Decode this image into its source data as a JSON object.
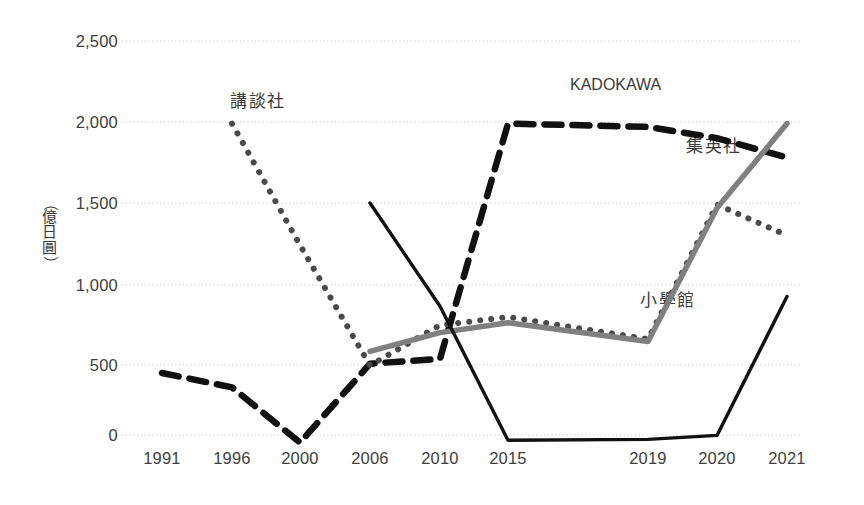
{
  "chart_data": {
    "type": "line",
    "title": "",
    "subtitle": "",
    "xlabel": "",
    "ylabel": "（億日圓）",
    "categories": [
      "1991",
      "1996",
      "2000",
      "2006",
      "2010",
      "2015",
      "2019",
      "2020",
      "2021"
    ],
    "ylim": [
      0,
      2500
    ],
    "yticks": [
      0,
      500,
      1000,
      1500,
      2000,
      2500
    ],
    "ytick_labels": [
      "0",
      "500",
      "1,000",
      "1,500",
      "2,000",
      "2,500"
    ],
    "grid": true,
    "legend_position": "inline-annotations",
    "series": [
      {
        "name": "KADOKAWA",
        "style": "dashed",
        "color": "#111111",
        "values": [
          550,
          640,
          985,
          1480,
          1450,
          2010,
          2030,
          2100,
          2220
        ]
      },
      {
        "name": "講談社",
        "style": "dotted",
        "color": "#4a4a4a",
        "values": [
          null,
          2010,
          1760,
          1490,
          1245,
          1195,
          1330,
          1510,
          1700
        ]
      },
      {
        "name": "集英社",
        "style": "solid-gray",
        "color": "#808080",
        "values": [
          null,
          null,
          null,
          1405,
          1290,
          1230,
          1345,
          1530,
          2010
        ]
      },
      {
        "name": "小學館",
        "style": "solid-black",
        "color": "#111111",
        "values": [
          null,
          null,
          null,
          1500,
          1130,
          970,
          965,
          940,
          1070
        ]
      }
    ]
  },
  "annotations": [
    {
      "text": "KADOKAWA",
      "series": "KADOKAWA",
      "script": "latin"
    },
    {
      "text": "講談社",
      "series": "講談社",
      "script": "cjk"
    },
    {
      "text": "集英社",
      "series": "集英社",
      "script": "cjk"
    },
    {
      "text": "小學館",
      "series": "小學館",
      "script": "cjk"
    }
  ],
  "colors": {
    "gridline": "#c9c9c9",
    "tick_text": "#404040",
    "kadokawa": "#111111",
    "kodansha": "#4a4a4a",
    "shueisha": "#808080",
    "shogakukan": "#111111",
    "background": "#ffffff"
  }
}
